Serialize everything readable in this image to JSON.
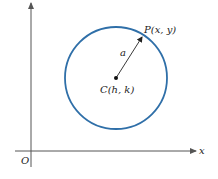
{
  "diagram": {
    "type": "circle-definition",
    "labels": {
      "point": "P(x, y)",
      "center": "C(h, k)",
      "radius": "a",
      "origin": "O",
      "x_axis": "x",
      "y_axis": "y"
    },
    "colors": {
      "circle": "#2f6fa8",
      "axes": "#555555",
      "text": "#222222",
      "radius_arrow": "#222222"
    },
    "geometry": {
      "center": [
        116,
        78
      ],
      "radius": 51,
      "point": [
        143,
        36
      ],
      "origin": [
        31,
        151
      ]
    }
  }
}
